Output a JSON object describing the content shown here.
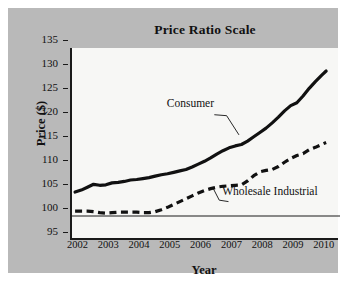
{
  "chart_data": {
    "type": "line",
    "title": "Price Ratio Scale",
    "xlabel": "Year",
    "ylabel": "Price ($)",
    "xlim": [
      2001.5,
      2010.2
    ],
    "ylim": [
      95,
      135
    ],
    "ytick_labels": [
      "135",
      "130",
      "125",
      "120",
      "115",
      "110",
      "105",
      "100",
      "95"
    ],
    "yticks": [
      135,
      130,
      125,
      120,
      115,
      110,
      105,
      100,
      95
    ],
    "xtick_labels": [
      "2002",
      "2003",
      "2004",
      "2005",
      "2006",
      "2007",
      "2008",
      "2009",
      "2010"
    ],
    "xticks": [
      2002,
      2003,
      2004,
      2005,
      2006,
      2007,
      2008,
      2009,
      2010
    ],
    "grid": false,
    "legend_position": "inline-annotations",
    "reference_line": {
      "y": 100,
      "style": "thin-solid",
      "color": "#1a1a1a"
    },
    "x": [
      2001.6,
      2001.8,
      2002.0,
      2002.2,
      2002.4,
      2002.6,
      2002.8,
      2003.0,
      2003.2,
      2003.4,
      2003.6,
      2003.8,
      2004.0,
      2004.2,
      2004.4,
      2004.6,
      2004.8,
      2005.0,
      2005.2,
      2005.4,
      2005.6,
      2005.8,
      2006.0,
      2006.2,
      2006.4,
      2006.6,
      2006.8,
      2007.0,
      2007.2,
      2007.4,
      2007.6,
      2007.8,
      2008.0,
      2008.2,
      2008.4,
      2008.6,
      2008.8,
      2009.0,
      2009.2,
      2009.4,
      2009.6,
      2009.75
    ],
    "series": [
      {
        "name": "Consumer",
        "style": "solid",
        "color": "#111111",
        "values": [
          105.0,
          105.4,
          106.0,
          106.6,
          106.4,
          106.5,
          106.9,
          107.0,
          107.2,
          107.5,
          107.6,
          107.8,
          108.0,
          108.3,
          108.6,
          108.8,
          109.1,
          109.4,
          109.7,
          110.2,
          110.8,
          111.4,
          112.1,
          112.9,
          113.6,
          114.2,
          114.6,
          114.9,
          115.6,
          116.5,
          117.4,
          118.3,
          119.4,
          120.6,
          121.9,
          123.0,
          123.6,
          125.0,
          126.6,
          128.0,
          129.3,
          130.2
        ]
      },
      {
        "name": "Wholesale Industrial",
        "style": "dashed",
        "color": "#111111",
        "values": [
          101.0,
          101.0,
          101.0,
          100.9,
          100.7,
          100.6,
          100.7,
          100.8,
          100.8,
          100.8,
          100.8,
          100.7,
          100.7,
          100.9,
          101.3,
          101.8,
          102.4,
          103.0,
          103.6,
          104.2,
          104.8,
          105.3,
          105.7,
          106.0,
          106.2,
          106.3,
          106.4,
          106.5,
          107.3,
          108.4,
          109.2,
          109.5,
          109.7,
          110.3,
          111.2,
          112.0,
          112.6,
          113.0,
          113.8,
          114.3,
          114.9,
          115.3
        ]
      }
    ],
    "annotations": [
      {
        "text": "Consumer",
        "label_x": 2004.9,
        "label_y": 121.5
      },
      {
        "text": "Wholesale Industrial",
        "label_x": 2006.7,
        "label_y": 103.2
      }
    ]
  }
}
